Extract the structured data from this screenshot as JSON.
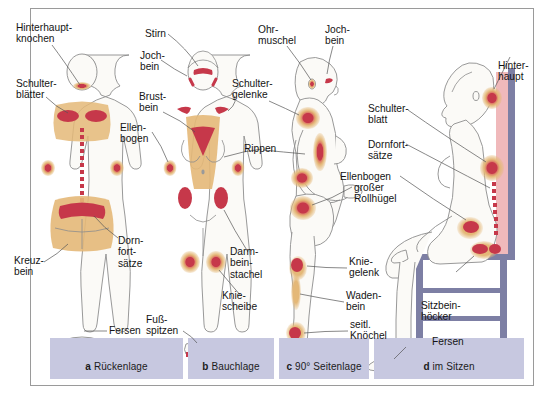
{
  "figure": {
    "colors": {
      "hotspot_core": "#c6384a",
      "hotspot_halo": "#e4b878",
      "skin_outline": "#8d8d8d",
      "skin_fill": "#fbfaf7",
      "caption_bar": "#c7c8e0",
      "chair_frame": "#7d7fa4",
      "chair_back": "#f0b9bb",
      "frame_border": "#9a9a9a",
      "text": "#141414"
    }
  },
  "panels": [
    {
      "key": "a",
      "letter": "a",
      "caption": "Rückenlage",
      "labels": [
        {
          "id": "hinterhauptknochen",
          "text": "Hinterhaupt-\nknochen"
        },
        {
          "id": "schulterblaetter",
          "text": "Schulter-\nblätter"
        },
        {
          "id": "kreuzbein",
          "text": "Kreuz-\nbein"
        },
        {
          "id": "dornfortsaetze",
          "text": "Dorn-\nfort-\nsätze"
        },
        {
          "id": "fersen",
          "text": "Fersen"
        }
      ]
    },
    {
      "key": "b",
      "letter": "b",
      "caption": "Bauchlage",
      "labels": [
        {
          "id": "stirn",
          "text": "Stirn"
        },
        {
          "id": "jochbein",
          "text": "Joch-\nbein"
        },
        {
          "id": "brustbein",
          "text": "Brust-\nbein"
        },
        {
          "id": "ellenbogen",
          "text": "Ellen-\nbogen"
        },
        {
          "id": "schultergelenke",
          "text": "Schulter-\ngelenke"
        },
        {
          "id": "rippen",
          "text": "Rippen"
        },
        {
          "id": "darmbeinstachel",
          "text": "Darm-\nbein-\nstachel"
        },
        {
          "id": "kniescheibe",
          "text": "Knie-\nscheibe"
        },
        {
          "id": "fussspitzen",
          "text": "Fuß-\nspitzen"
        }
      ]
    },
    {
      "key": "c",
      "letter": "c",
      "caption": "90° Seitenlage",
      "labels": [
        {
          "id": "ohrmuschel",
          "text": "Ohr-\nmuschel"
        },
        {
          "id": "jochbein_c",
          "text": "Joch-\nbein"
        },
        {
          "id": "grosser_rollhuegel",
          "text": "großer\nRollhügel"
        },
        {
          "id": "kniegelenk",
          "text": "Knie-\ngelenk"
        },
        {
          "id": "wadenbein",
          "text": "Waden-\nbein"
        },
        {
          "id": "seitl_knoechel",
          "text": "seitl.\nKnöchel"
        }
      ]
    },
    {
      "key": "d",
      "letter": "d",
      "caption": "im Sitzen",
      "labels": [
        {
          "id": "hinterhaupt",
          "text": "Hinter-\nhaupt"
        },
        {
          "id": "schulterblatt",
          "text": "Schulter-\nblatt"
        },
        {
          "id": "dornfortsaetze_d",
          "text": "Dornfort-\nsätze"
        },
        {
          "id": "ellenbogen_d",
          "text": "Ellenbogen"
        },
        {
          "id": "sitzbeinhoecker",
          "text": "Sitzbein-\nhöcker"
        },
        {
          "id": "fersen_d",
          "text": "Fersen"
        }
      ]
    }
  ]
}
